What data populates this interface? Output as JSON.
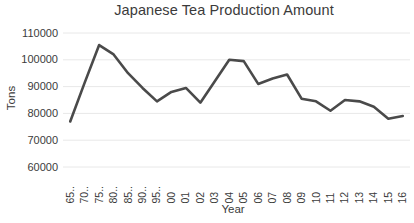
{
  "chart_data": {
    "type": "line",
    "title": "Japanese Tea Production Amount",
    "xlabel": "Year",
    "ylabel": "Tons",
    "grid": true,
    "legend": false,
    "line_color": "#4a4a4a",
    "background_color": "#ffffff",
    "gridline_color": "#e8e8e8",
    "ylim": [
      60000,
      110000
    ],
    "y_ticks": [
      110000,
      100000,
      90000,
      80000,
      70000,
      60000
    ],
    "y_tick_labels": [
      "110000",
      "100000",
      "90000",
      "80000",
      "70000",
      "60000"
    ],
    "categories": [
      "65..",
      "70..",
      "75..",
      "80..",
      "85..",
      "90..",
      "95..",
      "00",
      "01",
      "02",
      "03",
      "04",
      "05",
      "06",
      "07",
      "08",
      "09",
      "10",
      "11",
      "12",
      "13",
      "14",
      "15",
      "16"
    ],
    "values": [
      77000,
      91500,
      105500,
      102000,
      95000,
      89500,
      84500,
      88000,
      89500,
      84000,
      92000,
      100000,
      99500,
      91000,
      93000,
      94500,
      85500,
      84500,
      81000,
      85000,
      84500,
      82500,
      78000,
      79000
    ],
    "series": [
      {
        "name": "Tea Production",
        "values": [
          77000,
          91500,
          105500,
          102000,
          95000,
          89500,
          84500,
          88000,
          89500,
          84000,
          92000,
          100000,
          99500,
          91000,
          93000,
          94500,
          85500,
          84500,
          81000,
          85000,
          84500,
          82500,
          78000,
          79000
        ]
      }
    ]
  }
}
